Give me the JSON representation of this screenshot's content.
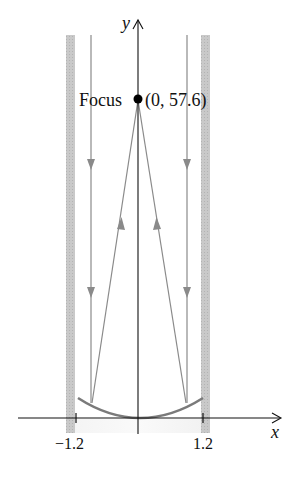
{
  "diagram": {
    "type": "parabolic-reflector",
    "axes": {
      "x_label": "x",
      "y_label": "y",
      "x_ticks": [
        {
          "value": -1.2,
          "label": "−1.2"
        },
        {
          "value": 1.2,
          "label": "1.2"
        }
      ]
    },
    "focus": {
      "label": "Focus",
      "coords_label": "(0, 57.6)",
      "x": 0,
      "y": 57.6
    },
    "rays": [
      {
        "direction": "incoming-down",
        "x": -1.0
      },
      {
        "direction": "incoming-down",
        "x": 1.0
      },
      {
        "direction": "reflected-up-to-focus",
        "from_x": -1.0
      },
      {
        "direction": "reflected-up-to-focus",
        "from_x": 1.0
      }
    ],
    "walls": [
      "left-wall",
      "right-wall"
    ],
    "colors": {
      "axis": "#111111",
      "ray": "#8a8a8a",
      "parabola": "#7a7a7a",
      "wall": "#c4c4c4",
      "focus_dot": "#000000"
    }
  }
}
